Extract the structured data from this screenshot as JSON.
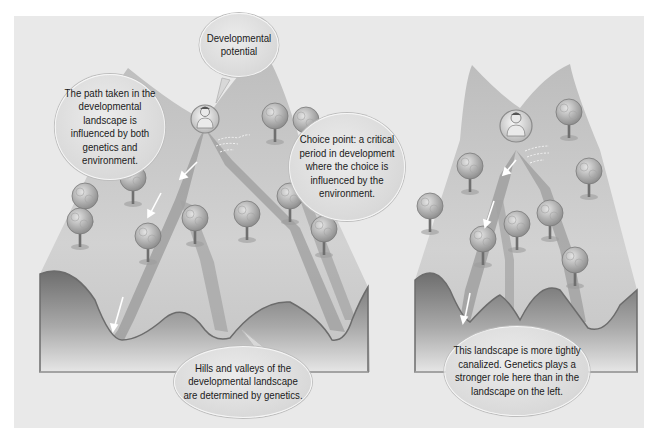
{
  "figure": {
    "colors": {
      "background": "#e9e9e9",
      "landscape_light": "#cfcfcf",
      "landscape_dark": "#8c8c8c",
      "valley_path": "#9a9a9a",
      "bubble_fill": "#dcdcdc",
      "arrow": "#ffffff"
    },
    "left_landscape": {
      "description": "Wide landscape with branching valleys",
      "callouts": {
        "developmental_potential": "Developmental potential",
        "path_taken": "The path taken in the developmental landscape is influenced by both genetics and environment.",
        "choice_point": "Choice point: a critical period in development where the choice is influenced by the environment.",
        "hills_valleys": "Hills and valleys of the developmental landscape are determined by genetics."
      },
      "icons": [
        "child-figure-icon",
        "wind-icon",
        "tree-icon",
        "arrow-icon"
      ]
    },
    "right_landscape": {
      "description": "Narrow, tightly canalized landscape",
      "callouts": {
        "canalized": "This landscape is more tightly canalized. Genetics plays a stronger role here than in the landscape on the left."
      },
      "icons": [
        "child-figure-icon",
        "wind-icon",
        "tree-icon",
        "arrow-icon"
      ]
    }
  }
}
